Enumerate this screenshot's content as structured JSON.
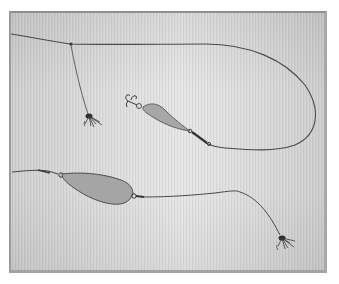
{
  "image": {
    "subject": "fishing-tackle-rigs",
    "background_color": "#dcdcdc",
    "frame_border_color": "#9a9a9a",
    "line_color": "#4a4a4a",
    "spoon_fill_color": "#a9a9a9",
    "spoon_edge_color": "#4f4f4f",
    "fly_color": "#3a3a3a"
  },
  "rigs": [
    {
      "name": "upper-rig",
      "components": [
        "main-line",
        "dropper-line",
        "fly",
        "spoon-lure",
        "treble-hook",
        "swivel"
      ]
    },
    {
      "name": "lower-rig",
      "components": [
        "main-line",
        "spoon-lure",
        "swivel",
        "trailing-line",
        "fly"
      ]
    }
  ]
}
